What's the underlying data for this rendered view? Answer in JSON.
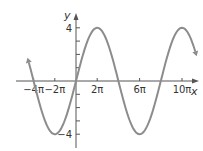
{
  "chart_data": {
    "type": "line",
    "title": "",
    "xlabel": "x",
    "ylabel": "y",
    "function": "y = 4 sin(x/4)",
    "amplitude": 4,
    "period": "8π",
    "xlim": [
      -5,
      12
    ],
    "ylim": [
      -4.5,
      4.5
    ],
    "x_units": "π",
    "x_ticks": [
      -4,
      -2,
      2,
      6,
      10
    ],
    "x_tick_labels": [
      "−4π",
      "−2π",
      "2π",
      "6π",
      "10π"
    ],
    "y_ticks": [
      -4,
      -3,
      -2,
      -1,
      1,
      2,
      3,
      4
    ],
    "y_tick_labels": [
      "−4",
      "4"
    ],
    "grid": false,
    "legend": null,
    "series": [
      {
        "name": "curve",
        "color": "#8c8c8c",
        "x_in_pi": [
          -4.6,
          -4,
          -2,
          0,
          2,
          4,
          6,
          8,
          10,
          11.3
        ],
        "y": [
          -0.75,
          0,
          -4,
          0,
          4,
          0,
          -4,
          0,
          4,
          2.5
        ]
      }
    ],
    "colors": {
      "curve": "#8c8c8c",
      "axes": "#555555",
      "text": "#333333"
    }
  }
}
